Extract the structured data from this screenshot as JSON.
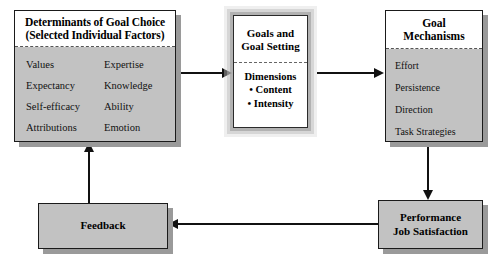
{
  "diagram": {
    "colors": {
      "box_fill": "#c2c2c2",
      "box_header_fill": "#ffffff",
      "box_border": "#1a1a1a",
      "shadow": "#9a9a9a",
      "connector": "#111111"
    },
    "determinants": {
      "header_line1": "Determinants of Goal Choice",
      "header_line2": "(Selected Individual Factors)",
      "factors": [
        {
          "left": "Values",
          "right": "Expertise"
        },
        {
          "left": "Expectancy",
          "right": "Knowledge"
        },
        {
          "left": "Self-efficacy",
          "right": "Ability"
        },
        {
          "left": "Attributions",
          "right": "Emotion"
        }
      ]
    },
    "goals": {
      "header_line1": "Goals and",
      "header_line2": "Goal Setting",
      "subhead": "Dimensions",
      "dimensions": [
        "• Content",
        "• Intensity"
      ]
    },
    "mechanisms": {
      "header_line1": "Goal",
      "header_line2": "Mechanisms",
      "items": [
        "Effort",
        "Persistence",
        "Direction",
        "Task Strategies"
      ]
    },
    "feedback": {
      "label": "Feedback"
    },
    "performance": {
      "line1": "Performance",
      "line2": "Job Satisfaction"
    },
    "connectors": [
      {
        "name": "determinants-to-goals",
        "direction": "right"
      },
      {
        "name": "goals-to-mechanisms",
        "direction": "right"
      },
      {
        "name": "mechanisms-to-performance",
        "direction": "down"
      },
      {
        "name": "performance-to-feedback",
        "direction": "left"
      },
      {
        "name": "feedback-to-determinants",
        "direction": "up"
      }
    ]
  }
}
